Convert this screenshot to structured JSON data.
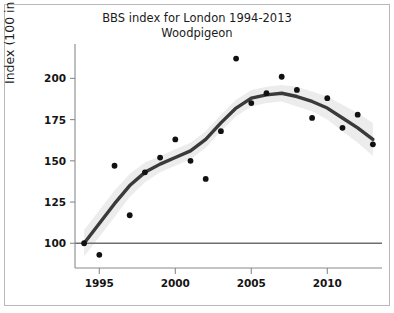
{
  "chart_data": {
    "type": "scatter",
    "title": "BBS index for London 1994-2013",
    "subtitle": "Woodpigeon",
    "xlabel": "",
    "ylabel": "Index (100 in 1994)",
    "xlim": [
      1993.4,
      2013.6
    ],
    "ylim": [
      85,
      216
    ],
    "xticks": [
      1995,
      2000,
      2005,
      2010
    ],
    "yticks": [
      100,
      125,
      150,
      175,
      200
    ],
    "grid": false,
    "legend": null,
    "reference_line": {
      "orientation": "horizontal",
      "value": 100,
      "color": "#6f6f6f"
    },
    "x": [
      1994,
      1995,
      1996,
      1997,
      1998,
      1999,
      2000,
      2001,
      2002,
      2003,
      2004,
      2005,
      2006,
      2007,
      2008,
      2009,
      2010,
      2011,
      2012,
      2013
    ],
    "values": [
      100,
      93,
      147,
      117,
      143,
      152,
      163,
      150,
      139,
      168,
      212,
      185,
      191,
      201,
      193,
      176,
      188,
      170,
      178,
      160
    ],
    "series": [
      {
        "name": "Annual index",
        "type": "scatter",
        "color": "#111111",
        "values": [
          100,
          93,
          147,
          117,
          143,
          152,
          163,
          150,
          139,
          168,
          212,
          185,
          191,
          201,
          193,
          176,
          188,
          170,
          178,
          160
        ]
      },
      {
        "name": "Smoothed trend",
        "type": "line",
        "color": "#3a3a3a",
        "values": [
          100,
          112,
          124,
          135,
          143,
          148,
          152,
          156,
          163,
          173,
          182,
          188,
          190,
          191,
          189,
          186,
          182,
          176,
          170,
          163
        ]
      },
      {
        "name": "Confidence band upper",
        "type": "area",
        "color": "#ececec",
        "values": [
          108,
          120,
          132,
          142,
          149,
          153,
          157,
          161,
          168,
          178,
          187,
          193,
          195,
          196,
          195,
          192,
          189,
          184,
          179,
          173
        ]
      },
      {
        "name": "Confidence band lower",
        "type": "area",
        "color": "#ececec",
        "values": [
          92,
          104,
          116,
          128,
          137,
          143,
          147,
          151,
          158,
          168,
          177,
          183,
          185,
          186,
          183,
          180,
          175,
          168,
          161,
          153
        ]
      }
    ]
  }
}
